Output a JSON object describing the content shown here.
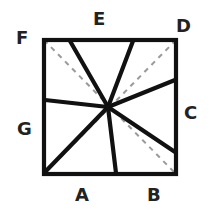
{
  "figure": {
    "background_color": "#ffffff",
    "solid_stroke_color": "#111111",
    "dashed_stroke_color": "#9a9a9a",
    "label_color": "#222222",
    "square": {
      "name": "outer-square",
      "top_left": [
        42,
        38
      ],
      "top_right": [
        178,
        38
      ],
      "bottom_right": [
        178,
        176
      ],
      "bottom_left": [
        42,
        176
      ],
      "stroke_width": 4
    },
    "center_point": [
      108,
      107
    ],
    "rays": [
      {
        "id": "ray-to-top-left",
        "from": [
          108,
          107
        ],
        "to": [
          70,
          39
        ],
        "edge": "top"
      },
      {
        "id": "ray-to-top-right",
        "from": [
          108,
          107
        ],
        "to": [
          133,
          39
        ],
        "edge": "top"
      },
      {
        "id": "ray-to-right-upper",
        "from": [
          108,
          107
        ],
        "to": [
          177,
          80
        ],
        "edge": "right"
      },
      {
        "id": "ray-to-right-lower",
        "from": [
          108,
          107
        ],
        "to": [
          177,
          152
        ],
        "edge": "right"
      },
      {
        "id": "ray-to-bottom",
        "from": [
          108,
          107
        ],
        "to": [
          116,
          175
        ],
        "edge": "bottom"
      },
      {
        "id": "ray-to-bottom-left",
        "from": [
          108,
          107
        ],
        "to": [
          44,
          174
        ],
        "edge": "corner"
      },
      {
        "id": "ray-to-left",
        "from": [
          108,
          107
        ],
        "to": [
          43,
          100
        ],
        "edge": "left"
      }
    ],
    "diagonals": [
      {
        "id": "diagonal-tl-br",
        "from": [
          44,
          40
        ],
        "to": [
          176,
          174
        ],
        "style": "dashed"
      },
      {
        "id": "diagonal-tr-bl",
        "from": [
          176,
          40
        ],
        "to": [
          44,
          174
        ],
        "style": "dashed"
      }
    ],
    "dash_pattern": "5 5",
    "dash_stroke_width": 2,
    "ray_stroke_width": 4,
    "labels": [
      {
        "id": "label-A",
        "text": "A",
        "position": [
          75,
          186
        ],
        "describes": "bottom-left region"
      },
      {
        "id": "label-B",
        "text": "B",
        "position": [
          147,
          186
        ],
        "describes": "bottom-right region"
      },
      {
        "id": "label-C",
        "text": "C",
        "position": [
          184,
          104
        ],
        "describes": "right region"
      },
      {
        "id": "label-D",
        "text": "D",
        "position": [
          176,
          17
        ],
        "describes": "top-right corner region"
      },
      {
        "id": "label-E",
        "text": "E",
        "position": [
          93,
          10
        ],
        "describes": "top region"
      },
      {
        "id": "label-F",
        "text": "F",
        "position": [
          16,
          29
        ],
        "describes": "top-left corner region"
      },
      {
        "id": "label-G",
        "text": "G",
        "position": [
          17,
          120
        ],
        "describes": "left region"
      }
    ]
  }
}
